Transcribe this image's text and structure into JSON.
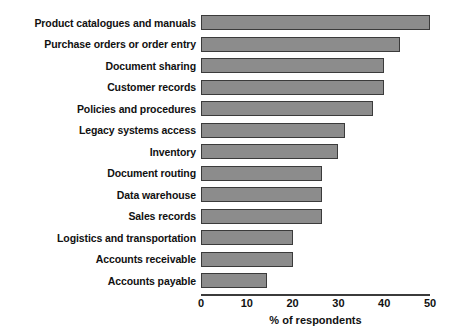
{
  "chart_data": {
    "type": "bar",
    "orientation": "horizontal",
    "title": "",
    "xlabel": "% of respondents",
    "ylabel": "",
    "xlim": [
      0,
      50
    ],
    "xticks": [
      0,
      10,
      20,
      30,
      40,
      50
    ],
    "xtick_labels": [
      "0",
      "10",
      "20",
      "30",
      "40",
      "50"
    ],
    "grid": false,
    "legend": false,
    "categories": [
      "Product catalogues and manuals",
      "Purchase orders or order entry",
      "Document sharing",
      "Customer records",
      "Policies and procedures",
      "Legacy systems access",
      "Inventory",
      "Document routing",
      "Data warehouse",
      "Sales records",
      "Logistics and transportation",
      "Accounts receivable",
      "Accounts payable"
    ],
    "values": [
      50,
      43.5,
      40,
      40,
      37.5,
      31.5,
      30,
      26.5,
      26.5,
      26.5,
      20,
      20,
      14.5
    ],
    "bar_fill_color": "#8c8c8c",
    "bar_edge_color": "#3b3b3b",
    "axis_color": "#3b3b3b",
    "background_color": "#ffffff"
  }
}
